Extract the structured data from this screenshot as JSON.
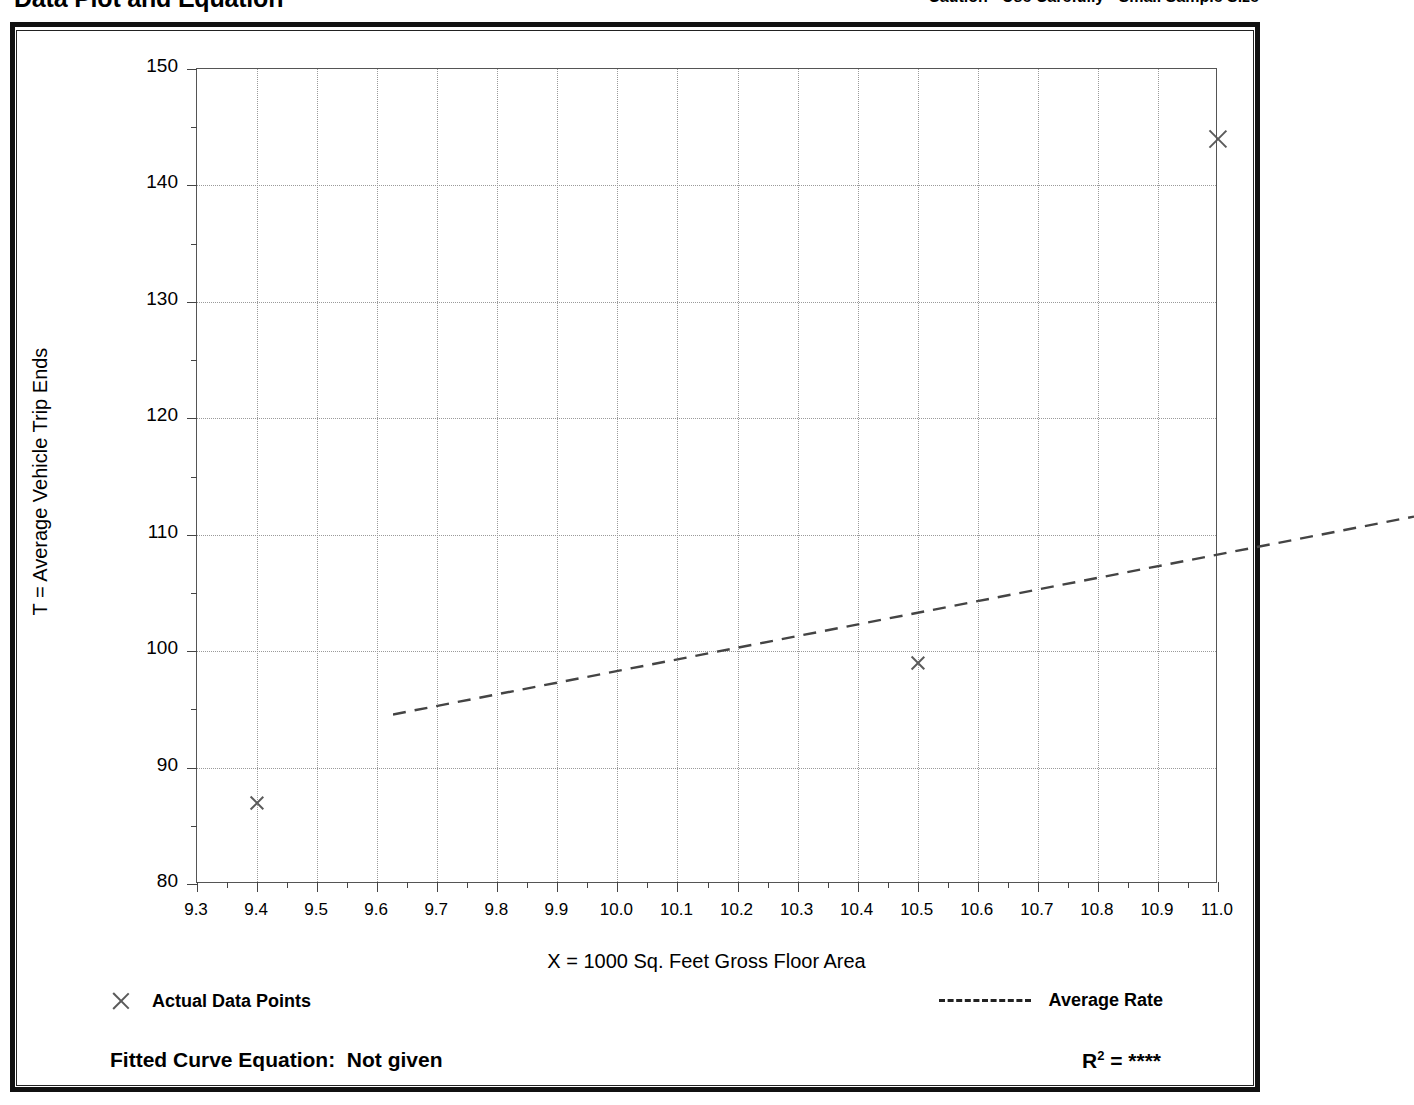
{
  "header": {
    "title": "Data Plot and Equation",
    "caution": "Caution - Use Carefully - Small Sample Size"
  },
  "legend": {
    "data_points_label": "Actual Data Points",
    "average_rate_label": "Average Rate",
    "point_marker_icon": "x-marker-icon",
    "rate_line_icon": "dashed-line-icon"
  },
  "equation": {
    "fitted_label": "Fitted Curve Equation:  Not given",
    "r_squared_prefix": "R",
    "r_squared_exponent": "2",
    "r_squared_value": " = ****"
  },
  "colors": {
    "frame": "#111111",
    "axis": "#555555",
    "grid": "#9a9a9a",
    "marker": "#5a5a5a",
    "trend": "#444444"
  },
  "chart_data": {
    "type": "scatter",
    "title": "Data Plot and Equation",
    "xlabel": "X = 1000 Sq. Feet Gross Floor Area",
    "ylabel": "T = Average Vehicle Trip Ends",
    "xlim": [
      9.3,
      11.0
    ],
    "ylim": [
      80,
      150
    ],
    "xticks": [
      9.3,
      9.4,
      9.5,
      9.6,
      9.7,
      9.8,
      9.9,
      10.0,
      10.1,
      10.2,
      10.3,
      10.4,
      10.5,
      10.6,
      10.7,
      10.8,
      10.9,
      11.0
    ],
    "xticklabels": [
      "9.3",
      "9.4",
      "9.5",
      "9.6",
      "9.7",
      "9.8",
      "9.9",
      "10.0",
      "10.1",
      "10.2",
      "10.3",
      "10.4",
      "10.5",
      "10.6",
      "10.7",
      "10.8",
      "10.9",
      "11.0"
    ],
    "yticks": [
      80,
      90,
      100,
      110,
      120,
      130,
      140,
      150
    ],
    "yticklabels": [
      "80",
      "90",
      "100",
      "110",
      "120",
      "130",
      "140",
      "150"
    ],
    "y_minor_ticks": [
      85,
      95,
      105,
      115,
      125,
      135,
      145
    ],
    "grid": true,
    "legend_position": "below-plot",
    "series": [
      {
        "name": "Actual Data Points",
        "type": "scatter",
        "marker": "x",
        "points": [
          {
            "x": 9.4,
            "y": 87
          },
          {
            "x": 10.5,
            "y": 99
          },
          {
            "x": 11.0,
            "y": 144
          }
        ]
      },
      {
        "name": "Average Rate",
        "type": "line",
        "style": "dashed",
        "points": [
          {
            "x": 9.3,
            "y": 100.4
          },
          {
            "x": 11.0,
            "y": 117.4
          }
        ]
      }
    ]
  }
}
